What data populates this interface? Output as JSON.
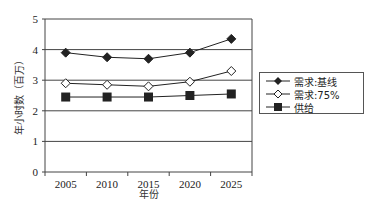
{
  "chart_data": {
    "type": "line",
    "title": "",
    "xlabel": "年份",
    "ylabel": "年小时数（百万）",
    "categories": [
      "2005",
      "2010",
      "2015",
      "2020",
      "2025"
    ],
    "ylim": [
      0,
      5
    ],
    "yticks": [
      "0",
      "1",
      "2",
      "3",
      "4",
      "5"
    ],
    "grid": true,
    "legend_position": "right",
    "series": [
      {
        "name": "需求:基线",
        "marker": "filled-diamond",
        "color": "#222222",
        "values": [
          3.9,
          3.75,
          3.7,
          3.9,
          4.35
        ]
      },
      {
        "name": "需求:75%",
        "marker": "hollow-diamond",
        "color": "#222222",
        "values": [
          2.9,
          2.85,
          2.8,
          2.95,
          3.3
        ]
      },
      {
        "name": "供给",
        "marker": "filled-square",
        "color": "#222222",
        "values": [
          2.45,
          2.45,
          2.45,
          2.5,
          2.55
        ]
      }
    ]
  },
  "legend": {
    "items": [
      {
        "label": "需求:基线",
        "icon": "filled-diamond-icon"
      },
      {
        "label": "需求:75%",
        "icon": "hollow-diamond-icon"
      },
      {
        "label": "供给",
        "icon": "filled-square-icon"
      }
    ]
  },
  "colors": {
    "line": "#222222",
    "grid": "#444444",
    "axis": "#444444"
  }
}
